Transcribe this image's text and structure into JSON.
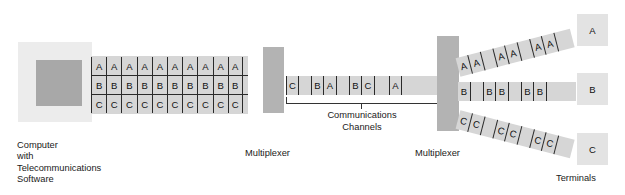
{
  "diagram": {
    "colors": {
      "cable": "#d6d6d6",
      "multiplexer": "#b3b3b3",
      "computer_outer": "#ececec",
      "computer_inner": "#a8a8a8",
      "terminal": "#e3e3e3",
      "line": "#2a2a2a",
      "text": "#1a1a1a"
    }
  },
  "computer": {
    "label": "Computer\nwith\nTelecommunications\nSoftware"
  },
  "host_cable": {
    "rows": [
      {
        "stream": "A",
        "cells": [
          "A",
          "A",
          "A",
          "A",
          "A",
          "A",
          "A",
          "A",
          "A",
          "A"
        ]
      },
      {
        "stream": "B",
        "cells": [
          "B",
          "B",
          "B",
          "B",
          "B",
          "B",
          "B",
          "B",
          "B",
          "B"
        ]
      },
      {
        "stream": "C",
        "cells": [
          "C",
          "C",
          "C",
          "C",
          "C",
          "C",
          "C",
          "C",
          "C",
          "C"
        ]
      }
    ]
  },
  "multiplexer_left": {
    "label": "Multiplexer"
  },
  "multiplexer_right": {
    "label": "Multiplexer"
  },
  "communications_channel": {
    "label": "Communications\nChannels",
    "segments": [
      {
        "type": "cell",
        "text": "C",
        "width": 13,
        "bar_left": true,
        "bar_right": true
      },
      {
        "type": "gap",
        "width": 12
      },
      {
        "type": "cell",
        "text": "B",
        "width": 13,
        "bar_left": true,
        "bar_right": true
      },
      {
        "type": "cell",
        "text": "A",
        "width": 13,
        "bar_left": false,
        "bar_right": true
      },
      {
        "type": "gap",
        "width": 12
      },
      {
        "type": "cell",
        "text": "B",
        "width": 13,
        "bar_left": true,
        "bar_right": true
      },
      {
        "type": "cell",
        "text": "C",
        "width": 13,
        "bar_left": false,
        "bar_right": true
      },
      {
        "type": "gap",
        "width": 14
      },
      {
        "type": "cell",
        "text": "A",
        "width": 13,
        "bar_left": true,
        "bar_right": true
      },
      {
        "type": "gap",
        "width": 36
      }
    ]
  },
  "output_channels": [
    {
      "stream": "A",
      "segments": [
        {
          "type": "cell",
          "text": "A",
          "width": 13,
          "bar_left": false,
          "bar_right": true
        },
        {
          "type": "cell",
          "text": "A",
          "width": 13,
          "bar_left": false,
          "bar_right": true
        },
        {
          "type": "gap",
          "width": 12
        },
        {
          "type": "cell",
          "text": "A",
          "width": 13,
          "bar_left": true,
          "bar_right": true
        },
        {
          "type": "cell",
          "text": "A",
          "width": 13,
          "bar_left": false,
          "bar_right": true
        },
        {
          "type": "gap",
          "width": 12
        },
        {
          "type": "cell",
          "text": "A",
          "width": 13,
          "bar_left": true,
          "bar_right": true
        },
        {
          "type": "cell",
          "text": "A",
          "width": 13,
          "bar_left": false,
          "bar_right": true
        },
        {
          "type": "gap",
          "width": 16
        }
      ]
    },
    {
      "stream": "B",
      "segments": [
        {
          "type": "cell",
          "text": "B",
          "width": 13,
          "bar_left": false,
          "bar_right": true
        },
        {
          "type": "gap",
          "width": 12
        },
        {
          "type": "cell",
          "text": "B",
          "width": 13,
          "bar_left": true,
          "bar_right": true
        },
        {
          "type": "cell",
          "text": "B",
          "width": 13,
          "bar_left": false,
          "bar_right": true
        },
        {
          "type": "gap",
          "width": 12
        },
        {
          "type": "cell",
          "text": "B",
          "width": 13,
          "bar_left": true,
          "bar_right": true
        },
        {
          "type": "cell",
          "text": "B",
          "width": 13,
          "bar_left": false,
          "bar_right": true
        },
        {
          "type": "gap",
          "width": 29
        }
      ]
    },
    {
      "stream": "C",
      "segments": [
        {
          "type": "cell",
          "text": "C",
          "width": 13,
          "bar_left": false,
          "bar_right": true
        },
        {
          "type": "cell",
          "text": "C",
          "width": 13,
          "bar_left": false,
          "bar_right": true
        },
        {
          "type": "gap",
          "width": 12
        },
        {
          "type": "cell",
          "text": "C",
          "width": 13,
          "bar_left": true,
          "bar_right": true
        },
        {
          "type": "cell",
          "text": "C",
          "width": 13,
          "bar_left": false,
          "bar_right": true
        },
        {
          "type": "gap",
          "width": 12
        },
        {
          "type": "cell",
          "text": "C",
          "width": 13,
          "bar_left": true,
          "bar_right": true
        },
        {
          "type": "cell",
          "text": "C",
          "width": 13,
          "bar_left": false,
          "bar_right": true
        },
        {
          "type": "gap",
          "width": 16
        }
      ]
    }
  ],
  "terminals": {
    "label": "Terminals",
    "items": [
      {
        "label": "A"
      },
      {
        "label": "B"
      },
      {
        "label": "C"
      }
    ]
  }
}
